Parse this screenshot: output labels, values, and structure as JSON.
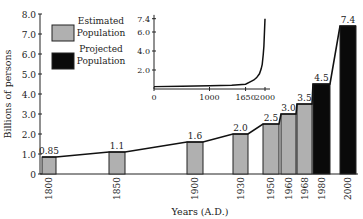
{
  "chart_data": {
    "type": "bar",
    "title": "",
    "xlabel": "Years (A.D.)",
    "ylabel": "Billions of persons",
    "ylim": [
      0,
      8.0
    ],
    "yticks": [
      "0",
      "1.0",
      "2.0",
      "3.0",
      "4.0",
      "5.0",
      "6.0",
      "7.0",
      "8.0"
    ],
    "categories": [
      "1800",
      "1850",
      "1900",
      "1930",
      "1950",
      "1960",
      "1968",
      "1980",
      "2000"
    ],
    "values": [
      0.85,
      1.1,
      1.6,
      2.0,
      2.5,
      3.0,
      3.5,
      4.5,
      7.4
    ],
    "value_labels": [
      "0.85",
      "1.1",
      "1.6",
      "2.0",
      "2.5",
      "3.0",
      "3.5",
      "4.5",
      "7.4"
    ],
    "series_type": [
      "estimated",
      "estimated",
      "estimated",
      "estimated",
      "estimated",
      "estimated",
      "estimated",
      "projected",
      "projected"
    ],
    "legend": [
      {
        "label_line1": "Estimated",
        "label_line2": "Population",
        "color": "#b0b0b0"
      },
      {
        "label_line1": "Projected",
        "label_line2": "Population",
        "color": "#0a0a0a"
      }
    ],
    "legend_position": "upper-left",
    "grid": false,
    "inset": {
      "type": "line",
      "xticks": [
        "0",
        "1000",
        "1650",
        "2000"
      ],
      "yticks": [
        "2.0",
        "4.0",
        "6.0",
        "7.4"
      ],
      "points": [
        [
          0,
          0.25
        ],
        [
          500,
          0.3
        ],
        [
          1000,
          0.35
        ],
        [
          1400,
          0.4
        ],
        [
          1650,
          0.5
        ],
        [
          1750,
          0.8
        ],
        [
          1800,
          0.95
        ],
        [
          1850,
          1.2
        ],
        [
          1900,
          1.6
        ],
        [
          1930,
          2.1
        ],
        [
          1950,
          2.6
        ],
        [
          1968,
          3.6
        ],
        [
          1980,
          4.5
        ],
        [
          2000,
          7.4
        ]
      ]
    }
  },
  "colors": {
    "estimated": "#b0b0b0",
    "projected": "#0a0a0a",
    "axis": "#222222"
  }
}
